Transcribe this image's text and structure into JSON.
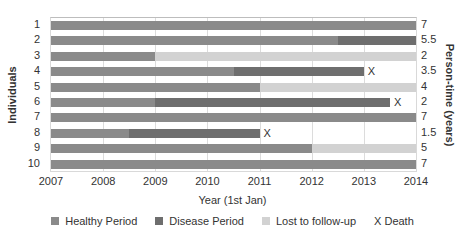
{
  "chart_data": {
    "type": "bar",
    "subtype": "horizontal-timeline-gantt",
    "title": "",
    "xlabel": "Year (1st Jan)",
    "ylabel": "Individuals",
    "ylabel_right": "Person-time (years)",
    "xlim": [
      2007,
      2014
    ],
    "x_ticks": [
      "2007",
      "2008",
      "2009",
      "2010",
      "2011",
      "2012",
      "2013",
      "2014"
    ],
    "grid": true,
    "legend_position": "bottom",
    "legend": [
      {
        "key": "healthy",
        "label": "Healthy Period",
        "color": "#8a8a8a"
      },
      {
        "key": "disease",
        "label": "Disease Period",
        "color": "#6e6e6e"
      },
      {
        "key": "lost",
        "label": "Lost to follow-up",
        "color": "#d2d2d2"
      },
      {
        "key": "death",
        "label": "X Death",
        "marker": "X"
      }
    ],
    "individuals": [
      {
        "id": "1",
        "person_time": "7",
        "segments": [
          {
            "type": "healthy",
            "start": 2007,
            "end": 2014
          }
        ],
        "death": null
      },
      {
        "id": "2",
        "person_time": "5.5",
        "segments": [
          {
            "type": "healthy",
            "start": 2007,
            "end": 2012.5
          },
          {
            "type": "disease",
            "start": 2012.5,
            "end": 2014
          }
        ],
        "death": null
      },
      {
        "id": "3",
        "person_time": "2",
        "segments": [
          {
            "type": "healthy",
            "start": 2007,
            "end": 2009
          },
          {
            "type": "lost",
            "start": 2009,
            "end": 2014
          }
        ],
        "death": null
      },
      {
        "id": "4",
        "person_time": "3.5",
        "segments": [
          {
            "type": "healthy",
            "start": 2007,
            "end": 2010.5
          },
          {
            "type": "disease",
            "start": 2010.5,
            "end": 2013
          }
        ],
        "death": 2013
      },
      {
        "id": "5",
        "person_time": "4",
        "segments": [
          {
            "type": "healthy",
            "start": 2007,
            "end": 2011
          },
          {
            "type": "lost",
            "start": 2011,
            "end": 2014
          }
        ],
        "death": null
      },
      {
        "id": "6",
        "person_time": "2",
        "segments": [
          {
            "type": "healthy",
            "start": 2007,
            "end": 2009
          },
          {
            "type": "disease",
            "start": 2009,
            "end": 2013.5
          }
        ],
        "death": 2013.5
      },
      {
        "id": "7",
        "person_time": "7",
        "segments": [
          {
            "type": "healthy",
            "start": 2007,
            "end": 2014
          }
        ],
        "death": null
      },
      {
        "id": "8",
        "person_time": "1.5",
        "segments": [
          {
            "type": "healthy",
            "start": 2007,
            "end": 2008.5
          },
          {
            "type": "disease",
            "start": 2008.5,
            "end": 2011
          }
        ],
        "death": 2011
      },
      {
        "id": "9",
        "person_time": "5",
        "segments": [
          {
            "type": "healthy",
            "start": 2007,
            "end": 2012
          },
          {
            "type": "lost",
            "start": 2012,
            "end": 2014
          }
        ],
        "death": null
      },
      {
        "id": "10",
        "person_time": "7",
        "segments": [
          {
            "type": "healthy",
            "start": 2007,
            "end": 2014
          }
        ],
        "death": null
      }
    ]
  },
  "labels": {
    "xlabel": "Year (1st Jan)",
    "ylabel": "Individuals",
    "ylabel_right": "Person-time (years)",
    "death_marker": "X"
  }
}
